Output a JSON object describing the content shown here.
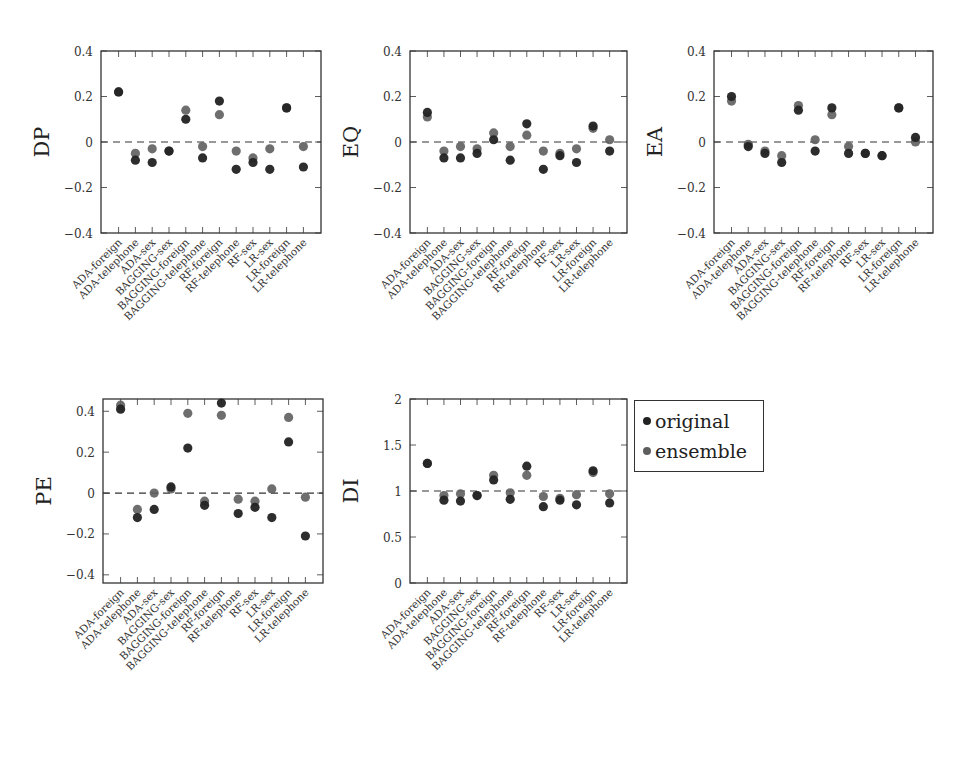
{
  "legend": {
    "items": [
      {
        "label": "original",
        "color": "#222222"
      },
      {
        "label": "ensemble",
        "color": "#5e5e5e"
      }
    ]
  },
  "colors": {
    "original": "#222222",
    "ensemble": "#5e5e5e",
    "axis": "#333333",
    "reference_line": "#333333"
  },
  "chart_data": [
    {
      "type": "scatter",
      "id": "DP",
      "title": "",
      "ylabel": "DP",
      "xlabel": "",
      "ylim": [
        -0.4,
        0.4
      ],
      "yticks": [
        -0.4,
        -0.2,
        0,
        0.2,
        0.4
      ],
      "ytick_labels": [
        "-0.4",
        "-0.2",
        "0",
        "0.2",
        "0.4"
      ],
      "reference_line": 0,
      "categories": [
        "ADA-foreign",
        "ADA-telephone",
        "ADA-sex",
        "BAGGING-sex",
        "BAGGING-foreign",
        "BAGGING-telephone",
        "RF-foreign",
        "RF-telephone",
        "RF-sex",
        "LR-sex",
        "LR-foreign",
        "LR-telephone"
      ],
      "series": [
        {
          "name": "original",
          "values": [
            0.22,
            -0.08,
            -0.09,
            -0.04,
            0.1,
            -0.07,
            0.18,
            -0.12,
            -0.09,
            -0.12,
            0.15,
            -0.11
          ]
        },
        {
          "name": "ensemble",
          "values": [
            0.22,
            -0.05,
            -0.03,
            -0.04,
            0.14,
            -0.02,
            0.12,
            -0.04,
            -0.07,
            -0.03,
            0.15,
            -0.02
          ]
        }
      ],
      "frame": {
        "x": 101,
        "y": 51,
        "w": 220,
        "h": 182
      },
      "grid": false
    },
    {
      "type": "scatter",
      "id": "EQ",
      "ylabel": "EQ",
      "ylim": [
        -0.4,
        0.4
      ],
      "yticks": [
        -0.4,
        -0.2,
        0,
        0.2,
        0.4
      ],
      "ytick_labels": [
        "-0.4",
        "-0.2",
        "0",
        "0.2",
        "0.4"
      ],
      "reference_line": 0,
      "categories": [
        "ADA-foreign",
        "ADA-telephone",
        "ADA-sex",
        "BAGGING-sex",
        "BAGGING-foreign",
        "BAGGING-telephone",
        "RF-foreign",
        "RF-telephone",
        "RF-sex",
        "LR-sex",
        "LR-foreign",
        "LR-telephone"
      ],
      "series": [
        {
          "name": "original",
          "values": [
            0.13,
            -0.07,
            -0.07,
            -0.05,
            0.01,
            -0.08,
            0.08,
            -0.12,
            -0.06,
            -0.09,
            0.07,
            -0.04
          ]
        },
        {
          "name": "ensemble",
          "values": [
            0.11,
            -0.04,
            -0.02,
            -0.03,
            0.04,
            -0.02,
            0.03,
            -0.04,
            -0.05,
            -0.03,
            0.06,
            0.01
          ]
        }
      ],
      "frame": {
        "x": 410,
        "y": 51,
        "w": 217,
        "h": 182
      },
      "grid": false
    },
    {
      "type": "scatter",
      "id": "EA",
      "ylabel": "EA",
      "ylim": [
        -0.4,
        0.4
      ],
      "yticks": [
        -0.4,
        -0.2,
        0,
        0.2,
        0.4
      ],
      "ytick_labels": [
        "-0.4",
        "-0.2",
        "0",
        "0.2",
        "0.4"
      ],
      "reference_line": 0,
      "categories": [
        "ADA-foreign",
        "ADA-telephone",
        "ADA-sex",
        "BAGGING-sex",
        "BAGGING-foreign",
        "BAGGING-telephone",
        "RF-foreign",
        "RF-telephone",
        "RF-sex",
        "LR-sex",
        "LR-foreign",
        "LR-telephone"
      ],
      "series": [
        {
          "name": "original",
          "values": [
            0.2,
            -0.02,
            -0.05,
            -0.09,
            0.14,
            -0.04,
            0.15,
            -0.05,
            -0.05,
            -0.06,
            0.15,
            0.02
          ]
        },
        {
          "name": "ensemble",
          "values": [
            0.18,
            -0.01,
            -0.04,
            -0.06,
            0.16,
            0.01,
            0.12,
            -0.02,
            -0.05,
            -0.06,
            0.15,
            0.0
          ]
        }
      ],
      "frame": {
        "x": 714,
        "y": 51,
        "w": 219,
        "h": 182
      },
      "grid": false
    },
    {
      "type": "scatter",
      "id": "PE",
      "ylabel": "PE",
      "ylim": [
        -0.44,
        0.46
      ],
      "yticks": [
        -0.4,
        -0.2,
        0,
        0.2,
        0.4
      ],
      "ytick_labels": [
        "-0.4",
        "-0.2",
        "0",
        "0.2",
        "0.4"
      ],
      "reference_line": 0,
      "categories": [
        "ADA-foreign",
        "ADA-telephone",
        "ADA-sex",
        "BAGGING-sex",
        "BAGGING-foreign",
        "BAGGING-telephone",
        "RF-foreign",
        "RF-telephone",
        "RF-sex",
        "LR-sex",
        "LR-foreign",
        "LR-telephone"
      ],
      "series": [
        {
          "name": "original",
          "values": [
            0.41,
            -0.12,
            -0.08,
            0.03,
            0.22,
            -0.06,
            0.44,
            -0.1,
            -0.07,
            -0.12,
            0.25,
            -0.21
          ]
        },
        {
          "name": "ensemble",
          "values": [
            0.43,
            -0.08,
            0.0,
            0.02,
            0.39,
            -0.04,
            0.38,
            -0.03,
            -0.04,
            0.02,
            0.37,
            -0.02
          ]
        }
      ],
      "frame": {
        "x": 103,
        "y": 399,
        "w": 220,
        "h": 184
      },
      "grid": false
    },
    {
      "type": "scatter",
      "id": "DI",
      "ylabel": "DI",
      "ylim": [
        0,
        2
      ],
      "yticks": [
        0,
        0.5,
        1,
        1.5,
        2
      ],
      "ytick_labels": [
        "0",
        "0.5",
        "1",
        "1.5",
        "2"
      ],
      "reference_line": 1,
      "categories": [
        "ADA-foreign",
        "ADA-telephone",
        "ADA-sex",
        "BAGGING-sex",
        "BAGGING-foreign",
        "BAGGING-telephone",
        "RF-foreign",
        "RF-telephone",
        "RF-sex",
        "LR-sex",
        "LR-foreign",
        "LR-telephone"
      ],
      "series": [
        {
          "name": "original",
          "values": [
            1.3,
            0.9,
            0.89,
            0.95,
            1.12,
            0.91,
            1.27,
            0.83,
            0.9,
            0.85,
            1.22,
            0.87
          ]
        },
        {
          "name": "ensemble",
          "values": [
            1.3,
            0.95,
            0.97,
            0.95,
            1.17,
            0.98,
            1.17,
            0.94,
            0.92,
            0.96,
            1.2,
            0.97
          ]
        }
      ],
      "frame": {
        "x": 410,
        "y": 399,
        "w": 217,
        "h": 184
      },
      "grid": false
    }
  ]
}
